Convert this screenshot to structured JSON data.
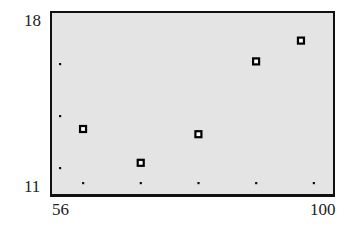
{
  "chart_data": {
    "type": "scatter",
    "title": "",
    "xlabel": "",
    "ylabel": "",
    "xlim": [
      56,
      100
    ],
    "ylim": [
      11,
      18
    ],
    "x_tick_labels": [
      "56",
      "100"
    ],
    "y_tick_labels": [
      "11",
      "18"
    ],
    "x_tick_marks": [
      61,
      70,
      79,
      88,
      97
    ],
    "y_tick_marks": [
      12,
      14,
      16
    ],
    "grid": false,
    "legend": null,
    "marker": "hollow-square",
    "background": "#e4e4e4",
    "series": [
      {
        "name": "data",
        "x": [
          61,
          70,
          79,
          88,
          95
        ],
        "y": [
          13.5,
          12.2,
          13.3,
          16.1,
          16.9
        ]
      }
    ]
  },
  "axis": {
    "y_max_label": "18",
    "y_min_label": "11",
    "x_min_label": "56",
    "x_max_label": "100"
  }
}
